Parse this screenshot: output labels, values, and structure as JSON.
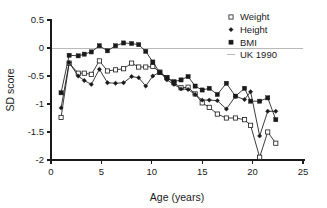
{
  "chart_data": {
    "type": "line",
    "title": "",
    "xlabel": "Age (years)",
    "ylabel": "SD score",
    "xlim": [
      0,
      25
    ],
    "ylim": [
      -2,
      0.5
    ],
    "xticks": [
      0,
      5,
      10,
      15,
      20,
      25
    ],
    "yticks": [
      0.5,
      0,
      -0.5,
      -1,
      -1.5,
      -2
    ],
    "xtick_labels": [
      "0",
      "5",
      "10",
      "15",
      "20",
      "25"
    ],
    "ytick_labels": [
      "0.5",
      "0",
      "-0.5",
      "-1",
      "-1.5",
      "-2"
    ],
    "grid": false,
    "reference_line": {
      "label": "UK 1990",
      "y": 0,
      "color": "#b9b9b9"
    },
    "legend_position": "top-right",
    "legend": [
      {
        "label": "Weight",
        "marker": "open-square"
      },
      {
        "label": "Height",
        "marker": "filled-diamond"
      },
      {
        "label": "BMI",
        "marker": "filled-square"
      },
      {
        "label": "UK 1990",
        "marker": "line"
      }
    ],
    "series": [
      {
        "name": "Weight",
        "marker": "open-square",
        "color": "#1a1a1a",
        "x": [
          1.0,
          1.8,
          2.7,
          3.3,
          4.0,
          4.8,
          5.6,
          6.4,
          7.2,
          8.0,
          8.7,
          9.4,
          10.1,
          10.8,
          11.5,
          12.2,
          12.9,
          13.6,
          14.3,
          15.0,
          15.7,
          16.5,
          17.4,
          18.3,
          19.2,
          19.8,
          20.7,
          21.5,
          22.3
        ],
        "y": [
          -1.24,
          -0.27,
          -0.45,
          -0.45,
          -0.47,
          -0.23,
          -0.41,
          -0.39,
          -0.37,
          -0.27,
          -0.34,
          -0.34,
          -0.33,
          -0.43,
          -0.53,
          -0.62,
          -0.71,
          -0.7,
          -0.82,
          -0.98,
          -1.06,
          -1.18,
          -1.25,
          -1.25,
          -1.28,
          -1.38,
          -1.95,
          -1.5,
          -1.7
        ]
      },
      {
        "name": "Height",
        "marker": "filled-diamond",
        "color": "#1a1a1a",
        "x": [
          1.0,
          1.8,
          2.7,
          3.3,
          4.0,
          4.8,
          5.6,
          6.4,
          7.2,
          8.0,
          8.7,
          9.4,
          10.1,
          10.8,
          11.5,
          12.2,
          12.9,
          13.6,
          14.3,
          15.0,
          15.7,
          16.5,
          17.4,
          18.3,
          19.2,
          19.8,
          20.7,
          21.5,
          22.3
        ],
        "y": [
          -1.07,
          -0.26,
          -0.5,
          -0.58,
          -0.65,
          -0.38,
          -0.62,
          -0.63,
          -0.62,
          -0.51,
          -0.53,
          -0.68,
          -0.5,
          -0.43,
          -0.57,
          -0.65,
          -0.73,
          -0.74,
          -0.83,
          -0.93,
          -0.93,
          -0.94,
          -1.09,
          -0.86,
          -0.92,
          -0.78,
          -1.57,
          -1.13,
          -1.13
        ]
      },
      {
        "name": "BMI",
        "marker": "filled-square",
        "color": "#1a1a1a",
        "x": [
          1.0,
          1.8,
          2.7,
          3.3,
          4.0,
          4.8,
          5.6,
          6.4,
          7.2,
          8.0,
          8.7,
          9.4,
          10.1,
          10.8,
          11.5,
          12.2,
          12.9,
          13.6,
          14.3,
          15.0,
          15.7,
          16.5,
          17.4,
          18.3,
          19.2,
          19.8,
          20.7,
          21.5,
          22.3
        ],
        "y": [
          -0.8,
          -0.13,
          -0.14,
          -0.11,
          -0.07,
          0.04,
          -0.05,
          0.04,
          0.09,
          0.08,
          0.06,
          -0.06,
          -0.25,
          -0.44,
          -0.53,
          -0.6,
          -0.57,
          -0.51,
          -0.68,
          -0.75,
          -0.72,
          -0.83,
          -0.63,
          -0.86,
          -0.72,
          -0.95,
          -0.95,
          -0.89,
          -1.28
        ]
      }
    ]
  }
}
